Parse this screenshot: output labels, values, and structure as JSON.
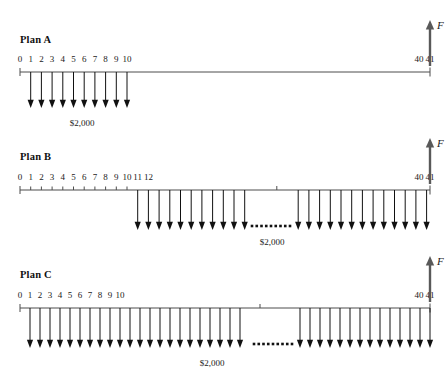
{
  "figure": {
    "type": "cash-flow-diagram",
    "width": 445,
    "height": 386,
    "background": "#ffffff",
    "line_color": "#4d4d4d",
    "arrow_color": "#111111",
    "f_arrow_color": "#595959"
  },
  "plans": [
    {
      "id": "plan-a",
      "title": "Plan A",
      "amount_label": "$2,000",
      "f_label": "F",
      "tick_labels": [
        "0",
        "1",
        "2",
        "3",
        "4",
        "5",
        "6",
        "7",
        "8",
        "9",
        "10"
      ],
      "end_labels": [
        "40",
        "41"
      ],
      "payment_periods_first": 1,
      "payment_periods_last": 10,
      "payment_count": 10,
      "has_ellipsis": false,
      "future_worth_period": 41
    },
    {
      "id": "plan-b",
      "title": "Plan B",
      "amount_label": "$2,000",
      "f_label": "F",
      "tick_labels": [
        "0",
        "1",
        "2",
        "3",
        "4",
        "5",
        "6",
        "7",
        "8",
        "9",
        "10",
        "11",
        "12"
      ],
      "end_labels": [
        "40",
        "41"
      ],
      "payment_periods_first": 11,
      "payment_periods_last": 41,
      "payment_count": 31,
      "has_ellipsis": true,
      "future_worth_period": 41
    },
    {
      "id": "plan-c",
      "title": "Plan C",
      "amount_label": "$2,000",
      "f_label": "F",
      "tick_labels": [
        "0",
        "1",
        "2",
        "3",
        "4",
        "5",
        "6",
        "7",
        "8",
        "9",
        "10"
      ],
      "end_labels": [
        "40",
        "41"
      ],
      "payment_periods_first": 1,
      "payment_periods_last": 41,
      "payment_count": 41,
      "has_ellipsis": true,
      "future_worth_period": 41
    }
  ],
  "chart_data": {
    "type": "bar",
    "xlabel": "Period (year)",
    "ylabel": "Cash flow ($)",
    "annotations": [
      "$2,000",
      "F"
    ],
    "series": [
      {
        "name": "Plan A",
        "x": [
          1,
          2,
          3,
          4,
          5,
          6,
          7,
          8,
          9,
          10
        ],
        "values": [
          -2000,
          -2000,
          -2000,
          -2000,
          -2000,
          -2000,
          -2000,
          -2000,
          -2000,
          -2000
        ],
        "future_worth_at": 41
      },
      {
        "name": "Plan B",
        "x": [
          11,
          12,
          13,
          14,
          15,
          16,
          17,
          18,
          19,
          20,
          21,
          22,
          23,
          24,
          25,
          26,
          27,
          28,
          29,
          30,
          31,
          32,
          33,
          34,
          35,
          36,
          37,
          38,
          39,
          40,
          41
        ],
        "values": [
          -2000,
          -2000,
          -2000,
          -2000,
          -2000,
          -2000,
          -2000,
          -2000,
          -2000,
          -2000,
          -2000,
          -2000,
          -2000,
          -2000,
          -2000,
          -2000,
          -2000,
          -2000,
          -2000,
          -2000,
          -2000,
          -2000,
          -2000,
          -2000,
          -2000,
          -2000,
          -2000,
          -2000,
          -2000,
          -2000,
          -2000
        ],
        "future_worth_at": 41
      },
      {
        "name": "Plan C",
        "x": [
          1,
          2,
          3,
          4,
          5,
          6,
          7,
          8,
          9,
          10,
          11,
          12,
          13,
          14,
          15,
          16,
          17,
          18,
          19,
          20,
          21,
          22,
          23,
          24,
          25,
          26,
          27,
          28,
          29,
          30,
          31,
          32,
          33,
          34,
          35,
          36,
          37,
          38,
          39,
          40,
          41
        ],
        "values": [
          -2000,
          -2000,
          -2000,
          -2000,
          -2000,
          -2000,
          -2000,
          -2000,
          -2000,
          -2000,
          -2000,
          -2000,
          -2000,
          -2000,
          -2000,
          -2000,
          -2000,
          -2000,
          -2000,
          -2000,
          -2000,
          -2000,
          -2000,
          -2000,
          -2000,
          -2000,
          -2000,
          -2000,
          -2000,
          -2000,
          -2000,
          -2000,
          -2000,
          -2000,
          -2000,
          -2000,
          -2000,
          -2000,
          -2000,
          -2000,
          -2000
        ],
        "future_worth_at": 41
      }
    ]
  }
}
